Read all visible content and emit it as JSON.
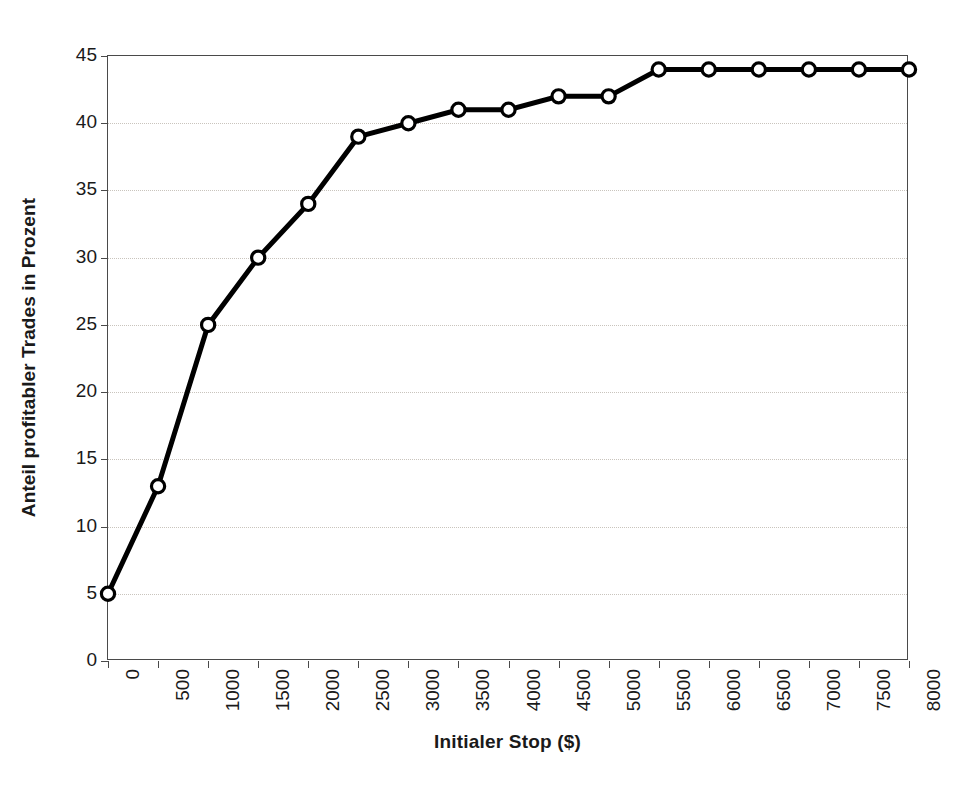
{
  "chart_data": {
    "type": "line",
    "title": "",
    "xlabel": "Initialer Stop ($)",
    "ylabel": "Anteil profitabler Trades in Prozent",
    "x": [
      0,
      500,
      1000,
      1500,
      2000,
      2500,
      3000,
      3500,
      4000,
      4500,
      5000,
      5500,
      6000,
      6500,
      7000,
      7500,
      8000
    ],
    "values": [
      5,
      13,
      25,
      30,
      34,
      39,
      40,
      41,
      41,
      42,
      42,
      44,
      44,
      44,
      44,
      44,
      44
    ],
    "series": [
      {
        "name": "Anteil profitabler Trades",
        "values": [
          5,
          13,
          25,
          30,
          34,
          39,
          40,
          41,
          41,
          42,
          42,
          44,
          44,
          44,
          44,
          44,
          44
        ]
      }
    ],
    "xlim": [
      0,
      8000
    ],
    "ylim": [
      0,
      45
    ],
    "xticks": [
      0,
      500,
      1000,
      1500,
      2000,
      2500,
      3000,
      3500,
      4000,
      4500,
      5000,
      5500,
      6000,
      6500,
      7000,
      7500,
      8000
    ],
    "xtick_labels": [
      "0",
      "500",
      "1000",
      "1500",
      "2000",
      "2500",
      "3000",
      "3500",
      "4000",
      "4500",
      "5000",
      "5500",
      "6000",
      "6500",
      "7000",
      "7500",
      "8000"
    ],
    "yticks": [
      0,
      5,
      10,
      15,
      20,
      25,
      30,
      35,
      40,
      45
    ],
    "ytick_labels": [
      "0",
      "5",
      "10",
      "15",
      "20",
      "25",
      "30",
      "35",
      "40",
      "45"
    ],
    "grid": true,
    "grid_axis": "y",
    "grid_style": "dotted",
    "legend": false,
    "legend_position": "none",
    "marker": "circle-open",
    "line_color": "#000000",
    "marker_face_color": "#ffffff",
    "marker_edge_color": "#000000",
    "grid_color": "#c9c4bd",
    "axis_color": "#4a4a4a",
    "background_color": "#ffffff",
    "xtick_label_rotation": 90
  }
}
